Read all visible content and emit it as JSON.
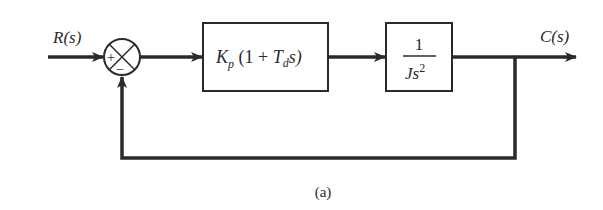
{
  "diagram": {
    "type": "block-diagram",
    "caption": "(a)",
    "input": {
      "label": "R(s)"
    },
    "output": {
      "label": "C(s)"
    },
    "summing_junction": {
      "plus_sign": "+",
      "minus_sign": "−"
    },
    "blocks": [
      {
        "id": "controller",
        "K": "K",
        "K_sub": "p",
        "open": " (1 + ",
        "T": "T",
        "T_sub": "d",
        "tail": "s)"
      },
      {
        "id": "plant",
        "numerator": "1",
        "den_J": "Js",
        "den_exp": "2"
      }
    ],
    "feedback": "unity negative feedback from C(s) to summing junction",
    "colors": {
      "line": "#2a2a2a",
      "background": "#ffffff"
    }
  }
}
